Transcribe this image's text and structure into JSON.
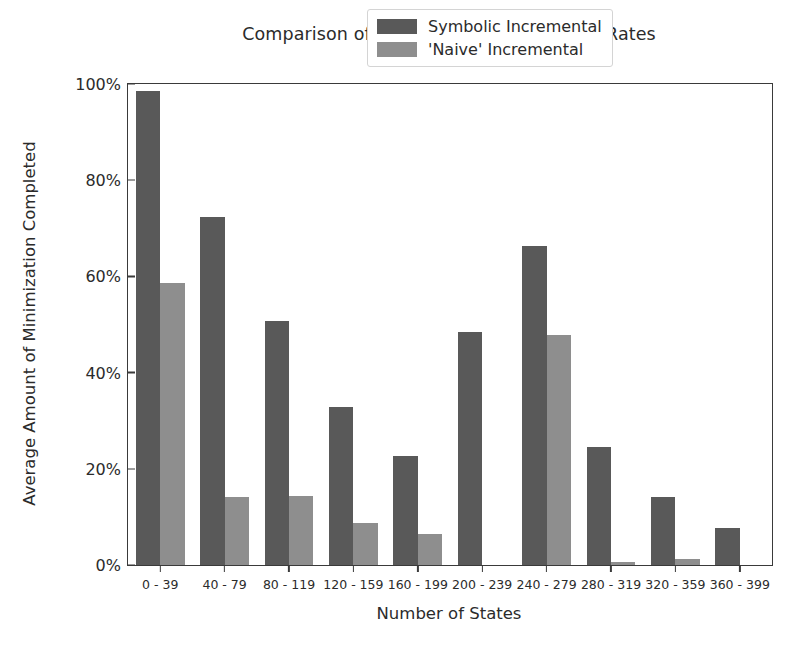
{
  "chart_data": {
    "type": "bar",
    "title": "Comparison of Incremental Minimization Rates",
    "xlabel": "Number of States",
    "ylabel": "Average Amount of Minimization Completed",
    "categories": [
      "0 - 39",
      "40 - 79",
      "80 - 119",
      "120 - 159",
      "160 - 199",
      "200 - 239",
      "240 - 279",
      "280 - 319",
      "320 - 359",
      "360 - 399"
    ],
    "series": [
      {
        "name": "Symbolic Incremental",
        "color": "#595959",
        "values": [
          98.6,
          72.3,
          50.7,
          32.9,
          22.6,
          48.4,
          66.4,
          24.5,
          14.2,
          7.7
        ]
      },
      {
        "name": "'Naive' Incremental",
        "color": "#8e8e8e",
        "values": [
          58.7,
          14.1,
          14.3,
          8.8,
          6.4,
          0.0,
          47.9,
          0.7,
          1.3,
          0.0
        ]
      }
    ],
    "ylim": [
      0,
      100
    ],
    "ytick_values": [
      0,
      20,
      40,
      60,
      80,
      100
    ],
    "ytick_labels": [
      "0%",
      "20%",
      "40%",
      "60%",
      "80%",
      "100%"
    ],
    "grid": false,
    "legend_position": "upper right",
    "bar_width_pct": 0.38
  }
}
